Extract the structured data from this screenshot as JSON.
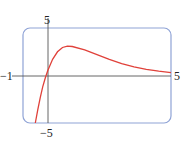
{
  "chart_data": {
    "type": "line",
    "title": "",
    "xlabel": "",
    "ylabel": "",
    "xlim": [
      -1,
      5
    ],
    "ylim": [
      -5,
      5
    ],
    "tick_labels": {
      "x_min": "−1",
      "x_max": "5",
      "y_max": "5",
      "y_min": "−5"
    },
    "grid": false,
    "legend": null,
    "series": [
      {
        "name": "f(x)",
        "color": "#e0413a",
        "x": [
          -0.5,
          -0.4,
          -0.3,
          -0.2,
          -0.1,
          0,
          0.2,
          0.4,
          0.6,
          0.8,
          1.0,
          1.5,
          2.0,
          2.5,
          3.0,
          3.5,
          4.0,
          4.5,
          5.0
        ],
        "y": [
          -5.0,
          -3.6,
          -2.3,
          -1.2,
          -0.3,
          0.5,
          1.7,
          2.5,
          2.95,
          3.1,
          3.05,
          2.7,
          2.2,
          1.7,
          1.25,
          0.9,
          0.65,
          0.45,
          0.3
        ]
      }
    ]
  },
  "colors": {
    "frame": "#8fa3d6",
    "axis": "#555555",
    "curve": "#e0413a"
  }
}
